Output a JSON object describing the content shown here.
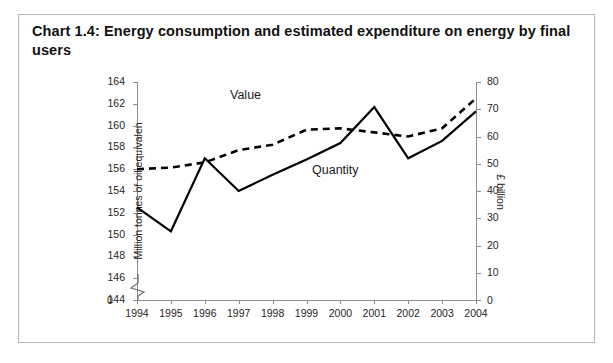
{
  "title": "Chart 1.4:  Energy consumption and estimated expenditure on energy by final users",
  "axes": {
    "left_title": "Million tonnes of oil equivalen",
    "right_title": "£ billion",
    "left_zero": "0",
    "right_zero": "0"
  },
  "series_labels": {
    "value": "Value",
    "quantity": "Quantity"
  },
  "chart_data": {
    "type": "line",
    "title": "Chart 1.4:  Energy consumption and estimated expenditure on energy by final users",
    "xlabel": "",
    "categories": [
      "1994",
      "1995",
      "1996",
      "1997",
      "1998",
      "1999",
      "2000",
      "2001",
      "2002",
      "2003",
      "2004"
    ],
    "grid": false,
    "legend_position": "inline-annotation",
    "axes": {
      "left": {
        "label": "Million tonnes of oil equivalen",
        "ticks": [
          144,
          146,
          148,
          150,
          152,
          154,
          156,
          158,
          160,
          162,
          164
        ],
        "ylim": [
          144,
          164
        ],
        "broken_axis": true,
        "break_base": "0"
      },
      "right": {
        "label": "£ billion",
        "ticks": [
          0,
          10,
          20,
          30,
          40,
          50,
          60,
          70,
          80
        ],
        "ylim": [
          0,
          80
        ]
      }
    },
    "series": [
      {
        "name": "Quantity",
        "axis": "left",
        "style": "solid",
        "color": "#000000",
        "unit": "Million tonnes of oil equivalent",
        "values": [
          152.5,
          150.3,
          157.0,
          154.0,
          155.5,
          156.9,
          158.4,
          161.7,
          157.0,
          158.6,
          161.3
        ]
      },
      {
        "name": "Value",
        "axis": "right",
        "style": "dashed",
        "color": "#000000",
        "unit": "£ billion",
        "values": [
          48.0,
          48.6,
          50.5,
          55.0,
          57.0,
          62.5,
          63.0,
          61.5,
          60.0,
          63.0,
          74.0
        ]
      }
    ]
  }
}
